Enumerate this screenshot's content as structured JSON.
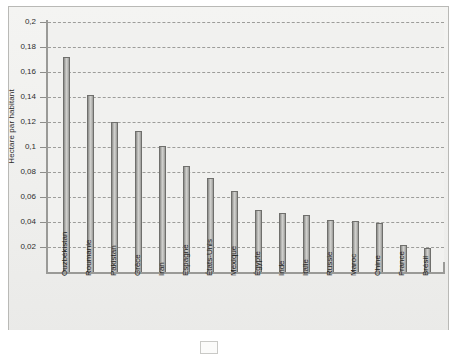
{
  "chart_data": {
    "type": "bar",
    "title": "",
    "subtitle": "",
    "xlabel": "",
    "ylabel": "Hectare par habitant",
    "ylim": [
      0,
      0.2
    ],
    "ytick_labels": [
      "0,2",
      "0,18",
      "0,16",
      "0,14",
      "0,12",
      "0,1",
      "0,08",
      "0,06",
      "0,04",
      "0,02"
    ],
    "ytick_values": [
      0.2,
      0.18,
      0.16,
      0.14,
      0.12,
      0.1,
      0.08,
      0.06,
      0.04,
      0.02
    ],
    "grid": true,
    "grid_style": "dashed-horizontal",
    "legend": null,
    "legend_position": "none",
    "categories": [
      "Ouzbékistan",
      "Roumanie",
      "Pakistan",
      "Grèce",
      "Iran",
      "Espagne",
      "États-Unis",
      "Mexique",
      "Égypte",
      "Inde",
      "Italie",
      "Russie",
      "Maroc",
      "Chine",
      "France",
      "Brésil"
    ],
    "values": [
      0.172,
      0.142,
      0.12,
      0.113,
      0.101,
      0.085,
      0.075,
      0.065,
      0.05,
      0.047,
      0.046,
      0.042,
      0.041,
      0.039,
      0.022,
      0.019
    ]
  },
  "colors": {
    "bar_fill_light": "#d2d2cf",
    "bar_fill_dark": "#8d8d8a",
    "bar_outline": "#6f6f6c",
    "plot_background": "#f1f1ef",
    "panel_background": "#f2f2f0",
    "panel_border": "#b9b9b6",
    "grid_line": "#9d9d9a",
    "axis_line": "#9a9a97",
    "text": "#1f1f1f"
  }
}
